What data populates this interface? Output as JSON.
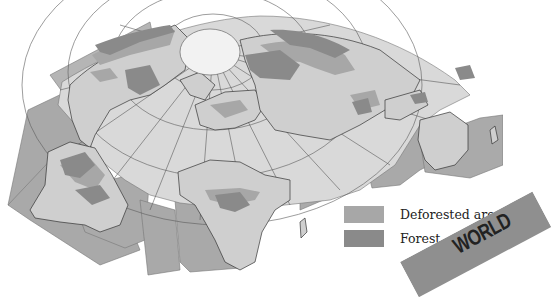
{
  "map": {
    "title": "World forest and deforestation map",
    "projection": "interrupted polar projection centered on the North Pole",
    "colors": {
      "ocean": "#d9d9d9",
      "ocean_outer": "#a9a9a9",
      "land": "#cfcfcf",
      "deforested": "#a7a7a7",
      "forest": "#8a8a8a",
      "pole": "#f2f2f2",
      "grid": "#555555"
    },
    "regions_depicted": [
      "North America",
      "South America",
      "Europe",
      "Africa",
      "Asia",
      "Australia",
      "Arctic"
    ]
  },
  "legend": {
    "items": [
      {
        "label": "Deforested areas",
        "color": "#a7a7a7"
      },
      {
        "label": "Forest",
        "color": "#8a8a8a"
      }
    ]
  },
  "banner": {
    "text": "WORLD",
    "color": "#8f8f8f"
  }
}
